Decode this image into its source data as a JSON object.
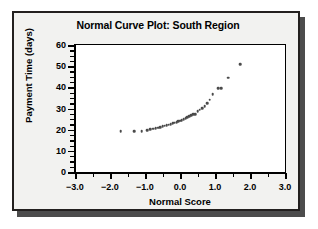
{
  "chart_data": {
    "type": "scatter",
    "title": "Normal Curve Plot: South Region",
    "xlabel": "Normal Score",
    "ylabel": "Payment Time (days)",
    "xlim": [
      -3.0,
      3.0
    ],
    "ylim": [
      0,
      60
    ],
    "x_ticks": [
      -3.0,
      -2.0,
      -1.0,
      0.0,
      1.0,
      2.0,
      3.0
    ],
    "x_tick_labels": [
      "−3.0",
      "−2.0",
      "−1.0",
      "0.0",
      "1.0",
      "2.0",
      "3.0"
    ],
    "x_minor_step": 0.5,
    "y_ticks": [
      0,
      10,
      20,
      30,
      40,
      50,
      60
    ],
    "y_tick_labels": [
      "0",
      "10",
      "20",
      "30",
      "40",
      "50",
      "60"
    ],
    "y_minor_step": 2.5,
    "grid": false,
    "legend": false,
    "marker": "filled-circle",
    "marker_color": "#4a4a4a",
    "series": [
      {
        "name": "Payment Time",
        "x": [
          -1.69,
          -1.31,
          -1.09,
          -0.94,
          -0.85,
          -0.77,
          -0.7,
          -0.63,
          -0.56,
          -0.5,
          -0.44,
          -0.38,
          -0.32,
          -0.27,
          -0.21,
          -0.16,
          -0.1,
          -0.05,
          0.0,
          0.05,
          0.1,
          0.16,
          0.21,
          0.27,
          0.32,
          0.38,
          0.44,
          0.5,
          0.56,
          0.63,
          0.7,
          0.77,
          0.85,
          0.94,
          1.09,
          1.17,
          1.38,
          1.72
        ],
        "y": [
          19.4,
          19.2,
          19.4,
          19.7,
          20.3,
          20.5,
          20.7,
          21.0,
          21.3,
          21.6,
          21.9,
          22.1,
          22.4,
          22.7,
          23.0,
          23.3,
          23.6,
          24.0,
          24.3,
          24.6,
          25.0,
          25.4,
          25.9,
          26.3,
          26.8,
          27.2,
          27.4,
          28.7,
          29.4,
          30.2,
          31.2,
          32.4,
          34.1,
          36.8,
          39.6,
          39.7,
          44.5,
          50.9
        ]
      }
    ]
  },
  "figure": {
    "title": "Normal Curve Plot: South Region",
    "x_axis_title": "Normal Score",
    "y_axis_title": "Payment Time (days)"
  },
  "colors": {
    "card_background": "#f2f2f0",
    "card_border": "#23201f",
    "plot_background": "#ffffff",
    "axis": "#000000",
    "marker": "#4a4a4a",
    "shadow": "#4c4c4c"
  }
}
